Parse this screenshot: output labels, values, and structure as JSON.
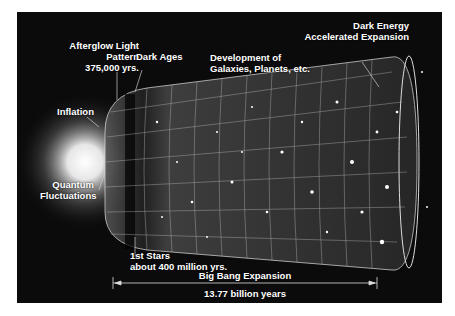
{
  "diagram": {
    "labels": {
      "afterglow": [
        "Afterglow Light",
        "Pattern",
        "375,000 yrs."
      ],
      "dark_ages": "Dark Ages",
      "development": [
        "Development of",
        "Galaxies, Planets, etc."
      ],
      "dark_energy": [
        "Dark Energy",
        "Accelerated Expansion"
      ],
      "inflation": "Inflation",
      "quantum": [
        "Quantum",
        "Fluctuations"
      ],
      "first_stars": [
        "1st Stars",
        "about 400 million yrs."
      ],
      "big_bang_expansion": "Big Bang Expansion",
      "duration": "13.77 billion years"
    },
    "colors": {
      "background": "#0b0b0b",
      "text": "#ffffff",
      "grid": "#cfcfcf"
    }
  }
}
